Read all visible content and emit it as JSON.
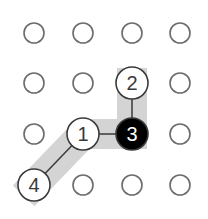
{
  "diagram": {
    "grid": {
      "cols": 4,
      "rows": 4,
      "x": [
        34,
        83,
        132,
        180
      ],
      "y": [
        33,
        83,
        134,
        185
      ],
      "dot_radius": 10,
      "dot_stroke": "#6b6b6b"
    },
    "highlight": {
      "color": "#d4d4d4",
      "width": 30,
      "path_nodes": [
        "4",
        "1",
        "3",
        "2"
      ]
    },
    "nodes": [
      {
        "id": "1",
        "label": "1",
        "col": 1,
        "row": 2,
        "fill": "#ffffff",
        "text_color": "#3a3a3a"
      },
      {
        "id": "2",
        "label": "2",
        "col": 2,
        "row": 1,
        "fill": "#ffffff",
        "text_color": "#3a3a3a"
      },
      {
        "id": "3",
        "label": "3",
        "col": 2,
        "row": 2,
        "fill": "#000000",
        "text_color": "#ffffff"
      },
      {
        "id": "4",
        "label": "4",
        "col": 0,
        "row": 3,
        "fill": "#ffffff",
        "text_color": "#3a3a3a"
      }
    ],
    "node_radius": 16,
    "node_stroke": "#3a3a3a",
    "edges": [
      {
        "from": "4",
        "to": "1"
      },
      {
        "from": "1",
        "to": "3"
      },
      {
        "from": "3",
        "to": "2"
      }
    ]
  }
}
